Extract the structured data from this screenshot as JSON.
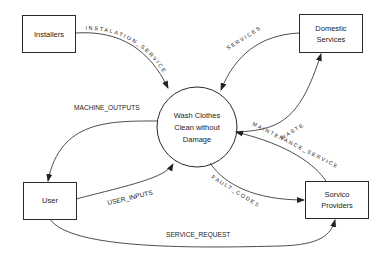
{
  "diagram": {
    "type": "data-flow-diagram (context)",
    "process": {
      "label_lines": [
        "Wash Clothes",
        "Clean without",
        "Damage"
      ]
    },
    "entities": {
      "installers": "Installers",
      "domestic": [
        "Domestic",
        "Services"
      ],
      "user": "User",
      "service_providers": [
        "Sorvico",
        "Providers"
      ]
    },
    "flows": {
      "installation_service": "INSTALATION_SERVICE",
      "services": "SERVICES",
      "waste": "WASTE",
      "machine_outputs": "MACHINE_OUTPUTS",
      "maintenance_service": "MAINTENANCE_SERVICE",
      "user_inputs": "USER_INPUTS",
      "fault_codes": "FAULT_CODES",
      "service_request": "SERVICE_REQUEST"
    },
    "colors": {
      "line": "#3a3a3a",
      "text": "#222222",
      "background": "#ffffff"
    }
  }
}
